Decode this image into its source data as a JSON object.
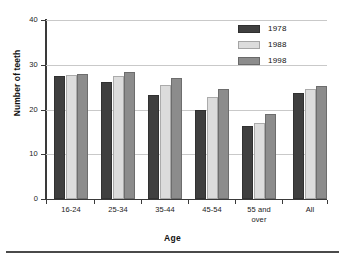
{
  "chart_data": {
    "type": "bar",
    "title": "",
    "xlabel": "Age",
    "ylabel": "Number of teeth",
    "categories": [
      "16-24",
      "25-34",
      "35-44",
      "45-54",
      "55 and over",
      "All"
    ],
    "category_lines": [
      [
        "16-24"
      ],
      [
        "25-34"
      ],
      [
        "35-44"
      ],
      [
        "45-54"
      ],
      [
        "55 and",
        "over"
      ],
      [
        "All"
      ]
    ],
    "series": [
      {
        "name": "1978",
        "color": "#3f3f3f",
        "values": [
          27.4,
          26.2,
          23.3,
          20.0,
          16.3,
          23.7
        ]
      },
      {
        "name": "1988",
        "color": "#dcdcdc",
        "values": [
          27.7,
          27.4,
          25.5,
          22.8,
          17.0,
          24.6
        ]
      },
      {
        "name": "1998",
        "color": "#8c8c8c",
        "values": [
          27.9,
          28.3,
          27.1,
          24.5,
          19.1,
          25.3
        ]
      }
    ],
    "ylim": [
      0,
      40
    ],
    "yticks": [
      0,
      10,
      20,
      30,
      40
    ],
    "ytick_labels": [
      "0",
      "10",
      "20",
      "30",
      "40"
    ],
    "grid": true,
    "grid_axis": "y",
    "legend_position": "top-right",
    "gap_before_last_group": true
  },
  "legend": {
    "entries": [
      {
        "label": "1978",
        "color": "#3f3f3f"
      },
      {
        "label": "1988",
        "color": "#dcdcdc"
      },
      {
        "label": "1998",
        "color": "#8c8c8c"
      }
    ]
  },
  "colors": {
    "series_1978": "#3f3f3f",
    "series_1988": "#dcdcdc",
    "series_1998": "#8c8c8c",
    "axis": "#3a3a3a",
    "gridline": "#c9c9c9",
    "background": "#ffffff"
  }
}
